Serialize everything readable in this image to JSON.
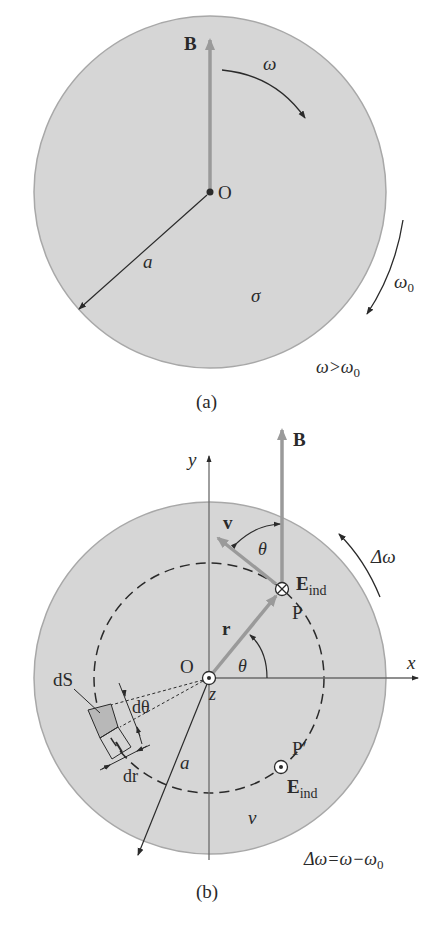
{
  "figure_a": {
    "caption": "(a)",
    "vector_B": "B",
    "omega": "ω",
    "origin": "O",
    "radius": "a",
    "conductivity": "σ",
    "omega0": "ω",
    "omega0_sub": "0",
    "condition_lhs": "ω>ω",
    "condition_sub": "0"
  },
  "figure_b": {
    "caption": "(b)",
    "axis_y": "y",
    "axis_x": "x",
    "axis_z": "z",
    "vector_B": "B",
    "velocity": "v",
    "angle_top": "θ",
    "delta_omega": "Δω",
    "E_ind_top": "E",
    "E_ind_top_sub": "ind",
    "point_P": "P",
    "position_r": "r",
    "angle_theta": "θ",
    "origin": "O",
    "dS": "dS",
    "d_theta": "dθ",
    "dr": "dr",
    "radius": "a",
    "point_P_prime": "P′",
    "E_ind_bottom": "E",
    "E_ind_bottom_sub": "ind",
    "nu": "ν",
    "relation": "Δω=ω−ω",
    "relation_sub": "0"
  },
  "colors": {
    "disk_fill": "#d6d6d6",
    "disk_edge": "#a8a8a8",
    "vector_gray": "#9a9a9a",
    "ink": "#2a2a2a",
    "element_fill": "#b8b8b8"
  }
}
